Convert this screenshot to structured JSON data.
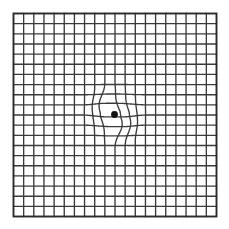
{
  "figure": {
    "width": 229,
    "height": 229,
    "background_color": "#ffffff"
  },
  "chart_data": {
    "type": "heatmap",
    "subtitle": "",
    "xlabel": "",
    "ylabel": "",
    "grid": true,
    "legend_position": "none",
    "xlim": [
      0,
      20
    ],
    "ylim": [
      0,
      20
    ],
    "categories": [],
    "values": [],
    "grid_spec": {
      "rows": 20,
      "columns": 20,
      "cell_size_px": 10.15,
      "origin_x_px": 13.5,
      "origin_y_px": 13.5,
      "extent_px": 203,
      "line_color": "#3a3a3a",
      "line_width_px": 1.35,
      "border_color": "#2a2a2a",
      "border_width_px": 1.9
    },
    "fixation_dot": {
      "label": "central fixation dot",
      "x_px": 114.5,
      "y_px": 114.5,
      "radius_px": 3.4,
      "color": "#111111"
    },
    "distortion": {
      "label": "metamorphopsia distortion zone",
      "center_x_px": 114.5,
      "center_y_px": 114.5,
      "radius_px": 34,
      "affected_vertical_lines": [
        9,
        10,
        11,
        12
      ],
      "affected_horizontal_lines": [
        9,
        10,
        11,
        12
      ],
      "max_offset_px": 5.5,
      "description": "vertical grid lines bow outward near the fixation dot"
    },
    "annotations": []
  }
}
